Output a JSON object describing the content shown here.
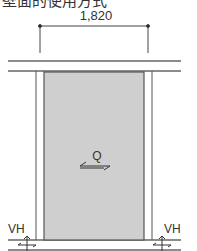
{
  "title": "壁面的使用方式",
  "dimension": {
    "value": "1,820"
  },
  "labels": {
    "shear": "Q",
    "left_vertical": "VH",
    "right_vertical": "VH"
  },
  "colors": {
    "line": "#555555",
    "panel_fill": "#cfcfcf",
    "text": "#333333"
  }
}
